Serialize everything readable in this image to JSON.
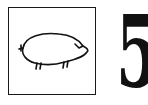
{
  "card": {
    "picture": {
      "subject": "pig",
      "style": "line-drawing",
      "icon": "pig-icon"
    },
    "number": "5"
  },
  "colors": {
    "ink": "#111111",
    "background": "#ffffff"
  }
}
